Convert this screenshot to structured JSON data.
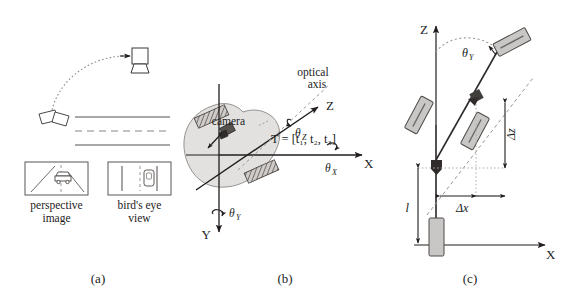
{
  "figure": {
    "background_color": "#ffffff",
    "ink_color": "#201d1c",
    "blob_fill": "#e2e0de",
    "box_fill": "#c9c7c5",
    "hatch_color": "#6e6a68",
    "width": 571,
    "height": 303
  },
  "panels": [
    {
      "id": "a",
      "letter": "(a)",
      "labels": {
        "perspective_image_line1": "perspective",
        "perspective_image_line2": "image",
        "birds_eye_line1": "bird's eye",
        "birds_eye_line2": "view"
      },
      "elements": {
        "camera_icon": "camera-icon",
        "vehicle_icon": "vehicle-icon",
        "arc_arrow": "curved-arrow",
        "road_lines": [
          "solid-lane-line",
          "dashed-lane-line",
          "solid-lane-line"
        ]
      }
    },
    {
      "id": "b",
      "letter": "(b)",
      "labels": {
        "optical_axis_line1": "optical",
        "optical_axis_line2": "axis",
        "camera": "camera",
        "axis_x": "X",
        "axis_y": "Y",
        "axis_z": "Z",
        "theta_x": "θ",
        "theta_x_sub": "X",
        "theta_y": "θ",
        "theta_y_sub": "Y",
        "theta_z": "θ",
        "theta_z_sub": "Z",
        "translation": "T = [t₁, t₂, t₃]"
      }
    },
    {
      "id": "c",
      "letter": "(c)",
      "labels": {
        "axis_x": "X",
        "axis_z": "Z",
        "theta_y": "θ",
        "theta_y_sub": "Y",
        "delta_x": "Δx",
        "delta_z": "Δz",
        "length_l": "l"
      }
    }
  ]
}
